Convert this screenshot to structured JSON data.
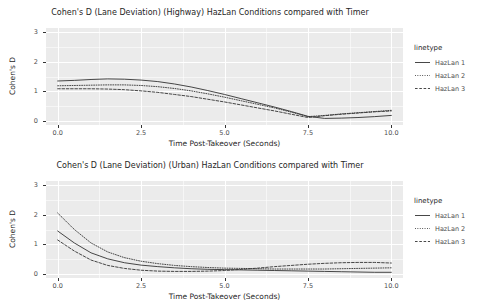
{
  "figure": {
    "axis_label_x": "Time Post-Takeover (Seconds)",
    "axis_label_y": "Cohen's D",
    "legend_title": "linetype",
    "legend_items": [
      {
        "label": "HazLan 1",
        "style": "solid"
      },
      {
        "label": "HazLan 2",
        "style": "dotted"
      },
      {
        "label": "HazLan 3",
        "style": "dashed"
      }
    ],
    "xticks": [
      "0.0",
      "2.5",
      "5.0",
      "7.5",
      "10.0"
    ],
    "yticks": [
      "0",
      "1",
      "2",
      "3"
    ],
    "plot_background": "#ebebeb",
    "grid_color": "#ffffff",
    "line_color": "#333333"
  },
  "chart_data": [
    {
      "type": "line",
      "id": "highway",
      "title": "Cohen's D (Lane Deviation) (Highway) HazLan Conditions compared with Timer",
      "xlabel": "Time Post-Takeover (Seconds)",
      "ylabel": "Cohen's D",
      "xlim": [
        -0.35,
        10.35
      ],
      "ylim": [
        -0.12,
        3.12
      ],
      "xticks": [
        0.0,
        2.5,
        5.0,
        7.5,
        10.0
      ],
      "yticks": [
        0,
        1,
        2,
        3
      ],
      "grid": true,
      "legend_position": "right",
      "x": [
        0.0,
        0.5,
        1.0,
        1.5,
        2.0,
        2.5,
        3.0,
        3.5,
        4.0,
        4.5,
        5.0,
        5.5,
        6.0,
        6.5,
        7.0,
        7.5,
        8.0,
        8.5,
        9.0,
        9.5,
        10.0
      ],
      "series": [
        {
          "name": "HazLan 1",
          "style": "solid",
          "values": [
            1.35,
            1.37,
            1.4,
            1.42,
            1.41,
            1.38,
            1.33,
            1.25,
            1.15,
            1.03,
            0.9,
            0.76,
            0.62,
            0.48,
            0.33,
            0.17,
            0.1,
            0.11,
            0.13,
            0.16,
            0.2
          ]
        },
        {
          "name": "HazLan 2",
          "style": "dotted",
          "values": [
            1.19,
            1.2,
            1.21,
            1.22,
            1.22,
            1.2,
            1.16,
            1.1,
            1.02,
            0.92,
            0.81,
            0.69,
            0.57,
            0.45,
            0.31,
            0.16,
            0.2,
            0.25,
            0.29,
            0.33,
            0.37
          ]
        },
        {
          "name": "HazLan 3",
          "style": "dashed",
          "values": [
            1.09,
            1.09,
            1.09,
            1.08,
            1.06,
            1.02,
            0.97,
            0.9,
            0.83,
            0.74,
            0.65,
            0.55,
            0.45,
            0.35,
            0.24,
            0.13,
            0.19,
            0.24,
            0.28,
            0.32,
            0.35
          ]
        }
      ]
    },
    {
      "type": "line",
      "id": "urban",
      "title": "Cohen's D (Lane Deviation) (Urban) HazLan Conditions compared with Timer",
      "xlabel": "Time Post-Takeover (Seconds)",
      "ylabel": "Cohen's D",
      "xlim": [
        -0.35,
        10.35
      ],
      "ylim": [
        -0.12,
        3.12
      ],
      "xticks": [
        0.0,
        2.5,
        5.0,
        7.5,
        10.0
      ],
      "yticks": [
        0,
        1,
        2,
        3
      ],
      "grid": true,
      "legend_position": "right",
      "x": [
        0.0,
        0.5,
        1.0,
        1.5,
        2.0,
        2.5,
        3.0,
        3.5,
        4.0,
        4.5,
        5.0,
        5.5,
        6.0,
        6.5,
        7.0,
        7.5,
        8.0,
        8.5,
        9.0,
        9.5,
        10.0
      ],
      "series": [
        {
          "name": "HazLan 1",
          "style": "solid",
          "values": [
            1.45,
            1.05,
            0.72,
            0.52,
            0.39,
            0.31,
            0.26,
            0.22,
            0.19,
            0.17,
            0.16,
            0.15,
            0.14,
            0.13,
            0.12,
            0.11,
            0.1,
            0.09,
            0.08,
            0.07,
            0.07
          ]
        },
        {
          "name": "HazLan 2",
          "style": "dotted",
          "values": [
            2.05,
            1.5,
            1.05,
            0.75,
            0.56,
            0.44,
            0.36,
            0.3,
            0.26,
            0.23,
            0.21,
            0.2,
            0.19,
            0.18,
            0.18,
            0.18,
            0.18,
            0.19,
            0.2,
            0.21,
            0.22
          ]
        },
        {
          "name": "HazLan 3",
          "style": "dashed",
          "values": [
            1.15,
            0.78,
            0.48,
            0.3,
            0.2,
            0.14,
            0.11,
            0.1,
            0.1,
            0.11,
            0.13,
            0.17,
            0.21,
            0.26,
            0.3,
            0.34,
            0.37,
            0.39,
            0.4,
            0.4,
            0.38
          ]
        }
      ]
    }
  ]
}
